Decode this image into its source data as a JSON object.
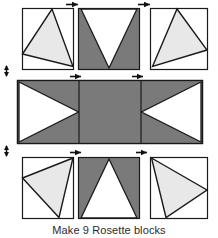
{
  "figure": {
    "caption": "Make 9 Rosette blocks",
    "width": 218,
    "height": 238
  },
  "colors": {
    "background": "#ffffff",
    "dark_fabric": "#7a7a7a",
    "light_fabric": "#e8e8e8",
    "white_fabric": "#ffffff",
    "outline": "#1a1a1a",
    "arrow": "#111111",
    "caption_text": "#2b2b2b"
  },
  "layout": {
    "rows": 3,
    "columns": 3,
    "row_labels": [
      "top-row",
      "middle-row",
      "bottom-row"
    ],
    "column_labels": [
      "left-column",
      "center-column",
      "right-column"
    ]
  },
  "units": [
    {
      "id": "top-left",
      "name": "top-left-unit",
      "row": 0,
      "col": 0,
      "shape": "light-triangle-on-white",
      "fabric": "light",
      "rect": {
        "x": 22,
        "y": 8,
        "w": 52,
        "h": 62
      },
      "triangle": [
        [
          22,
          54
        ],
        [
          52,
          8
        ],
        [
          73,
          66
        ]
      ]
    },
    {
      "id": "top-center",
      "name": "top-center-unit",
      "row": 0,
      "col": 1,
      "shape": "white-v-notch-on-dark",
      "fabric": "dark",
      "rect": {
        "x": 78,
        "y": 8,
        "w": 62,
        "h": 62
      },
      "triangle": [
        [
          81,
          9
        ],
        [
          137,
          9
        ],
        [
          109,
          68
        ]
      ]
    },
    {
      "id": "top-right",
      "name": "top-right-unit",
      "row": 0,
      "col": 2,
      "shape": "light-triangle-on-white",
      "fabric": "light",
      "rect": {
        "x": 150,
        "y": 8,
        "w": 58,
        "h": 62
      },
      "triangle": [
        [
          153,
          66
        ],
        [
          177,
          9
        ],
        [
          207,
          50
        ]
      ]
    },
    {
      "id": "middle-left",
      "name": "middle-left-unit",
      "row": 1,
      "col": 0,
      "shape": "white-triangle-pointing-right-on-dark",
      "fabric": "dark",
      "rect": {
        "x": 17,
        "y": 80,
        "w": 62,
        "h": 64
      },
      "triangle": [
        [
          18,
          82
        ],
        [
          18,
          142
        ],
        [
          78,
          112
        ]
      ]
    },
    {
      "id": "middle-center",
      "name": "middle-center-unit",
      "row": 1,
      "col": 1,
      "shape": "solid-dark-square",
      "fabric": "dark",
      "rect": {
        "x": 79,
        "y": 80,
        "w": 62,
        "h": 64
      },
      "triangle": null
    },
    {
      "id": "middle-right",
      "name": "middle-right-unit",
      "row": 1,
      "col": 2,
      "shape": "white-triangle-pointing-left-on-dark",
      "fabric": "dark",
      "rect": {
        "x": 141,
        "y": 80,
        "w": 62,
        "h": 64
      },
      "triangle": [
        [
          202,
          82
        ],
        [
          202,
          142
        ],
        [
          142,
          112
        ]
      ]
    },
    {
      "id": "bottom-left",
      "name": "bottom-left-unit",
      "row": 2,
      "col": 0,
      "shape": "light-triangle-on-white",
      "fabric": "light",
      "rect": {
        "x": 22,
        "y": 157,
        "w": 52,
        "h": 62
      },
      "triangle": [
        [
          22,
          178
        ],
        [
          73,
          158
        ],
        [
          59,
          217
        ]
      ]
    },
    {
      "id": "bottom-center",
      "name": "bottom-center-unit",
      "row": 2,
      "col": 1,
      "shape": "white-triangle-pointing-up-on-dark",
      "fabric": "dark",
      "rect": {
        "x": 78,
        "y": 157,
        "w": 62,
        "h": 62
      },
      "triangle": [
        [
          81,
          217
        ],
        [
          109,
          159
        ],
        [
          137,
          217
        ]
      ]
    },
    {
      "id": "bottom-right",
      "name": "bottom-right-unit",
      "row": 2,
      "col": 2,
      "shape": "light-triangle-on-white",
      "fabric": "light",
      "rect": {
        "x": 150,
        "y": 157,
        "w": 58,
        "h": 62
      },
      "triangle": [
        [
          151,
          158
        ],
        [
          207,
          190
        ],
        [
          166,
          217
        ]
      ]
    }
  ],
  "seam_arrows": [
    {
      "id": "arrow-top-row-left-seam",
      "name": "seam-arrow-top-left",
      "direction": "right",
      "x": 66,
      "y": 4
    },
    {
      "id": "arrow-top-row-right-seam",
      "name": "seam-arrow-top-right",
      "direction": "right",
      "x": 138,
      "y": 4
    },
    {
      "id": "arrow-middle-row-left-seam",
      "name": "seam-arrow-middle-left",
      "direction": "right",
      "x": 70,
      "y": 76
    },
    {
      "id": "arrow-middle-row-right-seam",
      "name": "seam-arrow-middle-right",
      "direction": "right",
      "x": 132,
      "y": 76
    },
    {
      "id": "arrow-bottom-row-left-seam",
      "name": "seam-arrow-bottom-left",
      "direction": "right",
      "x": 70,
      "y": 152
    },
    {
      "id": "arrow-bottom-row-right-seam",
      "name": "seam-arrow-bottom-right",
      "direction": "right",
      "x": 136,
      "y": 152
    },
    {
      "id": "arrow-left-upper-seam",
      "name": "seam-arrow-left-upper",
      "direction": "vertical",
      "x": 6,
      "y": 66
    },
    {
      "id": "arrow-left-lower-seam",
      "name": "seam-arrow-left-lower",
      "direction": "vertical",
      "x": 6,
      "y": 146
    }
  ]
}
